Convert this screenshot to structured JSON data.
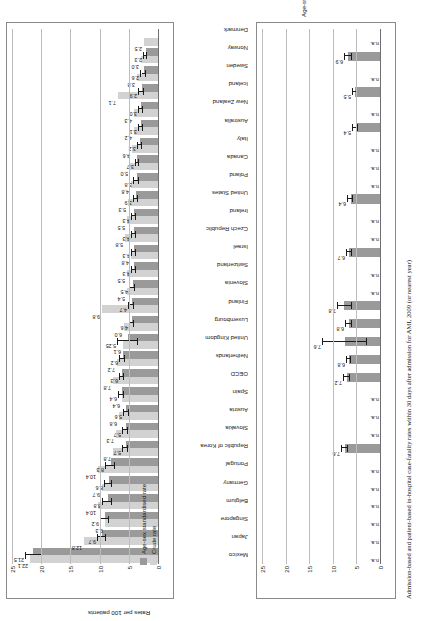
{
  "figure": {
    "left_panel_title": "Admission-based rates (same hospital)",
    "right_panel_title": "Patient-based rates (in & out of hospital)",
    "left_axis_label": "Rates per 100 patients",
    "right_axis_label": "Age-standardised rates per 100 patients",
    "caption": "Admission-based and patient-based in-hospital case-fatality rates within 30 days after admission for AMI, 2009 (or nearest year)",
    "legend": [
      {
        "key": "std",
        "label": "Age-sex standardised rate",
        "color": "#9a9a9a"
      },
      {
        "key": "crude",
        "label": "Crude rate",
        "color": "#d2d2d2"
      }
    ],
    "na_text": "n.a."
  },
  "chart_data": {
    "type": "bar",
    "title": "Admission-based and patient-based in-hospital case-fatality rates within 30 days after admission for AMI, 2009",
    "categories": [
      "Mexico",
      "Japan",
      "Singapore",
      "Belgium",
      "Germany",
      "Portugal",
      "Republic of Korea",
      "Slovakia",
      "Austria",
      "Spain",
      "OECD",
      "Netherlands",
      "United Kingdom",
      "Luxembourg",
      "Finland",
      "Slovenia",
      "Switzerland",
      "Israel",
      "Czech Republic",
      "Ireland",
      "United States",
      "Poland",
      "Canada",
      "Italy",
      "Australia",
      "New Zealand",
      "Iceland",
      "Sweden",
      "Norway",
      "Denmark"
    ],
    "panels": [
      {
        "name": "Admission-based rates (same hospital)",
        "xlabel": "Rates per 100 patients",
        "xlim": [
          0,
          25
        ],
        "xticks": [
          0,
          5,
          10,
          15,
          20,
          25
        ],
        "grid": true,
        "series": [
          {
            "name": "Age-sex standardised rate",
            "color": "#9a9a9a",
            "values": [
              21.5,
              9.7,
              9.2,
              8.8,
              8.6,
              8.3,
              5.7,
              5.7,
              5.6,
              6.4,
              6.3,
              6.2,
              5.25,
              4.6,
              4.7,
              4.5,
              4.3,
              4.3,
              4.3,
              4.3,
              3.9,
              3.8,
              3.7,
              3.2,
              3.1,
              3.0,
              2.9,
              2.6,
              2.3,
              null
            ]
          },
          {
            "name": "Crude rate",
            "color": "#d2d2d2",
            "values": [
              22.1,
              12.8,
              9.3,
              10.4,
              9.7,
              10.4,
              7.8,
              7.3,
              6.8,
              6.4,
              7.8,
              7.2,
              6.1,
              6.0,
              9.8,
              5.4,
              5.5,
              4.8,
              5.8,
              5.5,
              5.3,
              4.8,
              5.0,
              4.6,
              4.2,
              4.3,
              7.1,
              3.8,
              3.0,
              2.5
            ]
          }
        ],
        "value_labels_std": [
          "21.5",
          "9.7",
          "9.2",
          "8.8",
          "8.6",
          "8.3",
          "5.7",
          "5.7",
          "5.6",
          "6.4",
          "6.3",
          "6.2",
          "5.25",
          "4.6",
          "4.7",
          "4.5",
          "4.3",
          "4.3",
          "4.3",
          "4.3",
          "3.9",
          "3.8",
          "3.7",
          "3.2",
          "3.1",
          "3.0",
          "2.9",
          "2.6",
          "2.3",
          ""
        ],
        "value_labels_crude": [
          "22.1",
          "12.8",
          "9.3",
          "10.4",
          "9.7",
          "10.4",
          "7.8",
          "7.3",
          "6.8",
          "6.4",
          "7.8",
          "7.2",
          "6.1",
          "6.0",
          "9.8",
          "5.4",
          "5.5",
          "4.8",
          "5.8",
          "5.5",
          "5.3",
          "4.8",
          "5.0",
          "4.6",
          "4.2",
          "4.3",
          "7.1",
          "3.8",
          "3.0",
          "2.5"
        ],
        "error_bars": {
          "lower": [
            20.0,
            9.1,
            8.6,
            8.0,
            8.1,
            7.6,
            5.3,
            5.3,
            5.2,
            6.0,
            6.0,
            5.8,
            3.6,
            4.2,
            4.3,
            4.1,
            3.9,
            3.9,
            3.9,
            3.9,
            3.6,
            3.5,
            3.4,
            2.9,
            2.8,
            2.7,
            2.5,
            2.3,
            2.1,
            null
          ],
          "upper": [
            22.8,
            10.4,
            9.9,
            9.6,
            9.2,
            9.0,
            6.1,
            6.1,
            6.0,
            6.8,
            6.6,
            6.6,
            7.0,
            5.0,
            5.2,
            4.9,
            4.7,
            4.7,
            4.7,
            4.7,
            4.3,
            4.2,
            4.0,
            3.6,
            3.5,
            3.4,
            3.4,
            3.0,
            2.6,
            null
          ]
        }
      },
      {
        "name": "Patient-based rates (in & out of hospital)",
        "xlabel": "Age-standardised rates per 100 patients",
        "xlim": [
          0,
          25
        ],
        "xticks": [
          0,
          5,
          10,
          15,
          20,
          25
        ],
        "grid": true,
        "values": [
          null,
          null,
          null,
          null,
          null,
          null,
          7.6,
          null,
          null,
          null,
          7.2,
          6.8,
          7.6,
          6.8,
          7.8,
          null,
          null,
          6.7,
          null,
          null,
          6.4,
          null,
          null,
          null,
          5.4,
          null,
          5.5,
          null,
          6.9,
          null
        ],
        "value_labels": [
          "n.a.",
          "n.a.",
          "n.a.",
          "n.a.",
          "n.a.",
          "n.a.",
          "7.6",
          "n.a.",
          "n.a.",
          "n.a.",
          "7.2",
          "6.8",
          "7.6",
          "6.8",
          "7.8",
          "n.a.",
          "n.a.",
          "6.7",
          "n.a.",
          "n.a.",
          "6.4",
          "n.a.",
          "n.a.",
          "n.a.",
          "5.4",
          "n.a.",
          "5.5",
          "n.a.",
          "6.9",
          "n.a."
        ],
        "error_bars": {
          "lower": [
            null,
            null,
            null,
            null,
            null,
            null,
            7.0,
            null,
            null,
            null,
            6.6,
            6.4,
            2.9,
            6.2,
            6.2,
            null,
            null,
            6.2,
            null,
            null,
            6.0,
            null,
            null,
            null,
            4.9,
            null,
            5.1,
            null,
            6.2,
            null
          ],
          "upper": [
            null,
            null,
            null,
            null,
            null,
            null,
            8.2,
            null,
            null,
            null,
            7.8,
            7.2,
            12.2,
            7.4,
            9.2,
            null,
            null,
            7.2,
            null,
            null,
            6.9,
            null,
            null,
            null,
            5.9,
            null,
            5.9,
            null,
            7.6,
            null
          ]
        }
      }
    ]
  }
}
